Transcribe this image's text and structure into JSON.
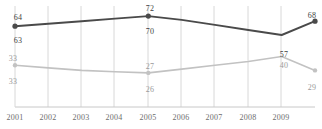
{
  "chart_data": {
    "type": "line",
    "title": "",
    "subtitle": "",
    "xlabel": "",
    "ylabel": "",
    "grid": true,
    "grid_orientation": "vertical",
    "legend": "none",
    "ylim": [
      0,
      80
    ],
    "xlim": [
      2001,
      2010
    ],
    "x": [
      2001,
      2002,
      2003,
      2004,
      2005,
      2006,
      2007,
      2008,
      2009,
      2010
    ],
    "categories": [
      "2001",
      "2002",
      "2003",
      "2004",
      "2005",
      "2006",
      "2007",
      "2008",
      "2009",
      "2010"
    ],
    "tick_labels": [
      "2001",
      "2002",
      "2003",
      "2004",
      "2005",
      "2006",
      "2007",
      "2008",
      "2009"
    ],
    "series": [
      {
        "name": "dark-series",
        "color": "#4a4a4a",
        "values": [
          64,
          66,
          68,
          70,
          72,
          69,
          65,
          61,
          57,
          68
        ],
        "labels": [
          {
            "x": 2001,
            "value": 64,
            "text": "64",
            "position": "above"
          },
          {
            "x": 2001,
            "value": 63,
            "text": "63",
            "position": "below"
          },
          {
            "x": 2005,
            "value": 72,
            "text": "72",
            "position": "above"
          },
          {
            "x": 2005,
            "value": 70,
            "text": "70",
            "position": "below"
          },
          {
            "x": 2009,
            "value": 57,
            "text": "57",
            "position": "below"
          },
          {
            "x": 2010,
            "value": 68,
            "text": "68",
            "position": "above"
          }
        ]
      },
      {
        "name": "light-series",
        "color": "#c2c2c2",
        "values": [
          33,
          31,
          29,
          28,
          27,
          30,
          33,
          36,
          40,
          29
        ],
        "labels": [
          {
            "x": 2001,
            "value": 33,
            "text": "33",
            "position": "above"
          },
          {
            "x": 2001,
            "value": 33,
            "text": "33",
            "position": "below"
          },
          {
            "x": 2005,
            "value": 27,
            "text": "27",
            "position": "above"
          },
          {
            "x": 2005,
            "value": 26,
            "text": "26",
            "position": "below"
          },
          {
            "x": 2009,
            "value": 40,
            "text": "40",
            "position": "above"
          },
          {
            "x": 2010,
            "value": 29,
            "text": "29",
            "position": "below"
          }
        ]
      }
    ]
  },
  "axis": {
    "tick_2001": "2001",
    "tick_2002": "2002",
    "tick_2003": "2003",
    "tick_2004": "2004",
    "tick_2005": "2005",
    "tick_2006": "2006",
    "tick_2007": "2007",
    "tick_2008": "2008",
    "tick_2009": "2009"
  },
  "point_labels": {
    "dark_2001_above": "64",
    "dark_2001_below": "63",
    "dark_2005_above": "72",
    "dark_2005_below": "70",
    "dark_2009_below": "57",
    "dark_2010_above": "68",
    "light_2001_above": "33",
    "light_2001_below": "33",
    "light_2005_above": "27",
    "light_2005_below": "26",
    "light_2009_above": "40",
    "light_2010_below": "29"
  },
  "colors": {
    "dark_line": "#4a4a4a",
    "light_line": "#c2c2c2",
    "gridline": "#d8d8d8",
    "axis": "#c8c8c8",
    "tick_text": "#6d6d6d"
  }
}
